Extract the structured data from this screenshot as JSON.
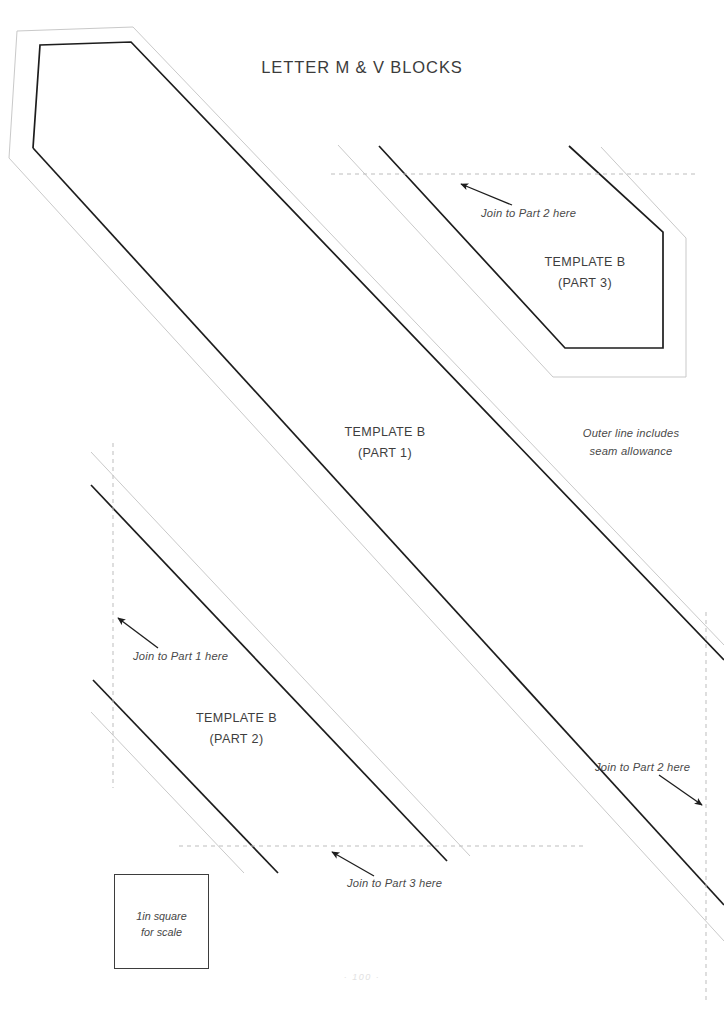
{
  "document": {
    "title": "LETTER M & V BLOCKS",
    "footer": "· 100 ·"
  },
  "labels": {
    "part1": {
      "name": "TEMPLATE B",
      "part": "(PART 1)"
    },
    "part2": {
      "name": "TEMPLATE B",
      "part": "(PART 2)"
    },
    "part3": {
      "name": "TEMPLATE B",
      "part": "(PART 3)"
    }
  },
  "notes": {
    "join_part2_top": "Join to Part 2 here",
    "join_part1": "Join to Part 1 here",
    "join_part3": "Join to Part 3 here",
    "join_part2_right": "Join to Part 2 here",
    "seam_line1": "Outer line includes",
    "seam_line2": "seam allowance"
  },
  "scale": {
    "line1": "1in square",
    "line2": "for scale"
  },
  "colors": {
    "cut_line": "#1d1d1d",
    "seam_line": "#c8c8c8",
    "join_line": "#bdbdbd",
    "text": "#3a3a3a",
    "background": "#ffffff"
  },
  "icons": {
    "arrow_join_part2_top": "arrow-up-left-icon",
    "arrow_join_part1": "arrow-up-left-icon",
    "arrow_join_part3": "arrow-up-left-icon",
    "arrow_join_part2_right": "arrow-down-right-icon"
  }
}
